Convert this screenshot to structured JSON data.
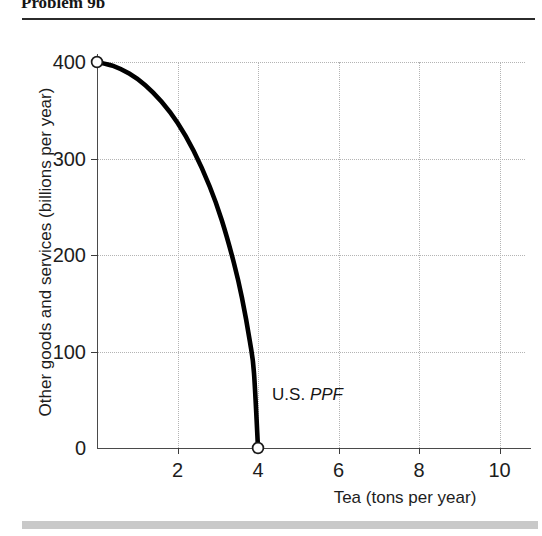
{
  "page": {
    "title": "Problem 9b",
    "has_top_rule": true,
    "has_bottom_band": true,
    "band_color": "#c9c9c9",
    "rule_color": "#2b2b2b"
  },
  "chart_data": {
    "type": "line",
    "title": "Problem 9b",
    "xlabel": "Tea (tons per year)",
    "ylabel": "Other goods and services (billions per year)",
    "xlim": [
      0,
      10.2
    ],
    "ylim": [
      0,
      420
    ],
    "xticks": [
      0,
      2,
      4,
      6,
      8,
      10
    ],
    "xtick_labels": [
      "0",
      "2",
      "4",
      "6",
      "8",
      "10"
    ],
    "yticks": [
      0,
      100,
      200,
      300,
      400
    ],
    "ytick_labels": [
      "0",
      "100",
      "200",
      "300",
      "400"
    ],
    "grid": true,
    "grid_style": "dotted",
    "grid_color": "#b4b4b4",
    "legend": null,
    "series": [
      {
        "name": "U.S. PPF",
        "line_color": "#000000",
        "line_width": 4.5,
        "x": [
          0.0,
          0.4,
          0.8,
          1.2,
          1.6,
          2.0,
          2.4,
          2.8,
          3.1,
          3.4,
          3.6,
          3.8,
          3.9,
          4.0
        ],
        "y": [
          400,
          396,
          388,
          376,
          359,
          337,
          308,
          271,
          236,
          192,
          156,
          110,
          78,
          0
        ]
      }
    ],
    "markers": [
      {
        "name": "y-intercept",
        "x": 0,
        "y": 400,
        "style": "open-circle"
      },
      {
        "name": "x-intercept",
        "x": 4,
        "y": 0,
        "style": "open-circle"
      }
    ],
    "annotations": [
      {
        "name": "ppf-label",
        "text_plain": "U.S. PPF",
        "text_roman": "U.S. ",
        "text_italic": "PPF",
        "x": 4.35,
        "y": 55
      }
    ]
  }
}
